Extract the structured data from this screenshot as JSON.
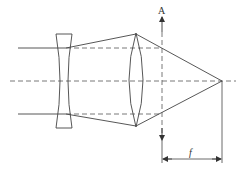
{
  "diagram": {
    "type": "optical-ray-diagram",
    "labels": {
      "principal_plane": "A",
      "focal_length": "f"
    },
    "elements": [
      {
        "name": "negative-lens",
        "kind": "diverging lens"
      },
      {
        "name": "positive-lens",
        "kind": "converging lens"
      },
      {
        "name": "optical-axis",
        "kind": "dashed center line"
      },
      {
        "name": "principal-plane-A",
        "kind": "dashed vertical line with arrows"
      },
      {
        "name": "focal-point",
        "kind": "ray convergence point"
      },
      {
        "name": "focal-length-dimension",
        "kind": "dimension line with arrows"
      }
    ],
    "colors": {
      "line": "#444444",
      "background": "#ffffff"
    }
  }
}
